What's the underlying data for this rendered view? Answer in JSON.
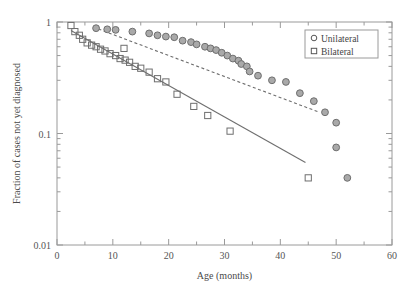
{
  "figure": {
    "background_color": "#ffffff",
    "frame_color": "#9a9a9a",
    "width": 406,
    "height": 292
  },
  "chart_data": {
    "type": "scatter",
    "title": "",
    "xlabel": "Age (months)",
    "ylabel": "Fraction of cases not yet diagnosed",
    "xlim": [
      0,
      60
    ],
    "ylim": [
      0.01,
      1
    ],
    "yscale": "log",
    "xscale": "linear",
    "grid": false,
    "legend_position": "top-right",
    "xticks": [
      0,
      10,
      20,
      30,
      40,
      50,
      60
    ],
    "xtick_labels": [
      "0",
      "10",
      "20",
      "30",
      "40",
      "50",
      "60"
    ],
    "xminor_ticks": [
      5,
      15,
      25,
      35,
      45,
      55
    ],
    "yticks": [
      1,
      0.1,
      0.01
    ],
    "ytick_labels": [
      "1",
      "0.1",
      "0.01"
    ],
    "series": [
      {
        "name": "Unilateral",
        "marker": "circle",
        "marker_fill": "#a9a9a9",
        "marker_edge": "#6e6e6e",
        "fit_line_style": "dashed",
        "fit_line_color": "#6e6e6e",
        "points": [
          {
            "x": 7.0,
            "y": 0.88
          },
          {
            "x": 9.0,
            "y": 0.86
          },
          {
            "x": 10.5,
            "y": 0.85
          },
          {
            "x": 13.5,
            "y": 0.82
          },
          {
            "x": 16.5,
            "y": 0.79
          },
          {
            "x": 18.0,
            "y": 0.76
          },
          {
            "x": 19.5,
            "y": 0.74
          },
          {
            "x": 21.0,
            "y": 0.73
          },
          {
            "x": 22.5,
            "y": 0.68
          },
          {
            "x": 24.0,
            "y": 0.66
          },
          {
            "x": 25.0,
            "y": 0.63
          },
          {
            "x": 26.5,
            "y": 0.6
          },
          {
            "x": 27.5,
            "y": 0.58
          },
          {
            "x": 28.5,
            "y": 0.56
          },
          {
            "x": 29.5,
            "y": 0.53
          },
          {
            "x": 30.5,
            "y": 0.5
          },
          {
            "x": 31.5,
            "y": 0.47
          },
          {
            "x": 32.5,
            "y": 0.45
          },
          {
            "x": 33.0,
            "y": 0.42
          },
          {
            "x": 34.0,
            "y": 0.4
          },
          {
            "x": 34.5,
            "y": 0.36
          },
          {
            "x": 36.0,
            "y": 0.33
          },
          {
            "x": 38.5,
            "y": 0.3
          },
          {
            "x": 41.0,
            "y": 0.29
          },
          {
            "x": 43.5,
            "y": 0.23
          },
          {
            "x": 46.0,
            "y": 0.195
          },
          {
            "x": 48.0,
            "y": 0.155
          },
          {
            "x": 50.0,
            "y": 0.125
          },
          {
            "x": 50.0,
            "y": 0.075
          },
          {
            "x": 52.0,
            "y": 0.04
          }
        ],
        "fit_line": {
          "x0": 6.5,
          "y0": 0.9,
          "x1": 47.0,
          "y1": 0.155
        }
      },
      {
        "name": "Bilateral",
        "marker": "square",
        "marker_fill": "none",
        "marker_edge": "#6e6e6e",
        "fit_line_style": "solid",
        "fit_line_color": "#6e6e6e",
        "points": [
          {
            "x": 2.5,
            "y": 0.93
          },
          {
            "x": 3.2,
            "y": 0.82
          },
          {
            "x": 4.0,
            "y": 0.76
          },
          {
            "x": 4.6,
            "y": 0.7
          },
          {
            "x": 5.4,
            "y": 0.65
          },
          {
            "x": 6.2,
            "y": 0.62
          },
          {
            "x": 7.0,
            "y": 0.6
          },
          {
            "x": 7.8,
            "y": 0.57
          },
          {
            "x": 8.6,
            "y": 0.55
          },
          {
            "x": 9.5,
            "y": 0.52
          },
          {
            "x": 10.5,
            "y": 0.5
          },
          {
            "x": 11.3,
            "y": 0.47
          },
          {
            "x": 12.2,
            "y": 0.455
          },
          {
            "x": 13.0,
            "y": 0.435
          },
          {
            "x": 14.0,
            "y": 0.4
          },
          {
            "x": 12.0,
            "y": 0.58
          },
          {
            "x": 15.0,
            "y": 0.385
          },
          {
            "x": 16.5,
            "y": 0.355
          },
          {
            "x": 18.0,
            "y": 0.31
          },
          {
            "x": 19.5,
            "y": 0.29
          },
          {
            "x": 21.5,
            "y": 0.225
          },
          {
            "x": 24.5,
            "y": 0.175
          },
          {
            "x": 27.0,
            "y": 0.145
          },
          {
            "x": 31.0,
            "y": 0.105
          },
          {
            "x": 45.0,
            "y": 0.04
          }
        ],
        "fit_line": {
          "x0": 2.5,
          "y0": 0.84,
          "x1": 44.5,
          "y1": 0.055
        }
      }
    ]
  },
  "legend": {
    "entries": [
      {
        "label": "Unilateral",
        "marker": "circle"
      },
      {
        "label": "Bilateral",
        "marker": "square"
      }
    ]
  }
}
